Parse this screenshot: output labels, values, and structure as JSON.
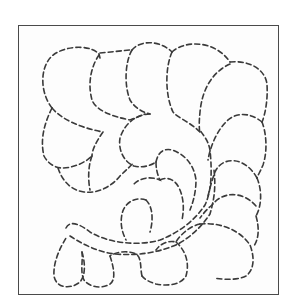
{
  "image": {
    "subject": "quilting-pattern",
    "description": "Dashed-line feather motif inside a square frame",
    "colors": {
      "line": "#3a3a3a",
      "frame": "#4a4a4a",
      "background": "#ffffff"
    }
  }
}
